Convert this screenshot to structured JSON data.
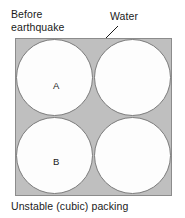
{
  "figure": {
    "top_label": "Before\nearthquake",
    "callout": {
      "label": "Water",
      "leader_icon": "leader-line-icon"
    },
    "caption": "Unstable (cubic) packing",
    "box": {
      "fill_color": "#bfbfbf",
      "border_color": "#8c8c8c",
      "grain_fill_color": "#fdfdfd",
      "grain_border_color": "#7d7d7d"
    },
    "grains": [
      {
        "position": "top-left",
        "label": "A"
      },
      {
        "position": "top-right",
        "label": ""
      },
      {
        "position": "bottom-left",
        "label": "B"
      },
      {
        "position": "bottom-right",
        "label": ""
      }
    ]
  }
}
